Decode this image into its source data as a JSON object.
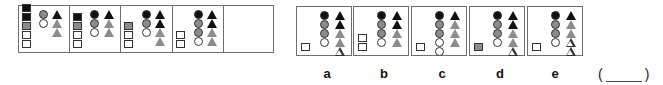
{
  "colors": {
    "black": "#111111",
    "gray": "#8c8c8c",
    "white": "#ffffff",
    "border": "#6e6e6e"
  },
  "sequence": {
    "panels": [
      {
        "squares": [
          "black",
          "black",
          "gray",
          "white",
          "white"
        ],
        "circles": [
          "gray",
          "white"
        ],
        "triangles": [
          "black",
          "gray",
          "gray"
        ]
      },
      {
        "squares": [
          "black",
          "gray",
          "white",
          "white"
        ],
        "circles": [
          "black",
          "gray",
          "white"
        ],
        "triangles": [
          "black",
          "gray",
          "gray"
        ]
      },
      {
        "squares": [
          "gray",
          "white",
          "white"
        ],
        "circles": [
          "black",
          "gray",
          "white"
        ],
        "triangles": [
          "black",
          "black",
          "gray",
          "gray"
        ]
      },
      {
        "squares": [
          "white",
          "white"
        ],
        "circles": [
          "black",
          "gray",
          "gray",
          "white"
        ],
        "triangles": [
          "black",
          "black",
          "gray",
          "gray"
        ]
      },
      {
        "squares": [],
        "circles": [],
        "triangles": [],
        "missing": true
      }
    ]
  },
  "options": [
    {
      "label": "a",
      "squares": [
        "white"
      ],
      "circles": [
        "black",
        "gray",
        "gray",
        "white"
      ],
      "triangles": [
        "black",
        "black",
        "gray",
        "gray",
        "white"
      ]
    },
    {
      "label": "b",
      "squares": [
        "white",
        "white"
      ],
      "circles": [
        "black",
        "gray",
        "gray",
        "white"
      ],
      "triangles": [
        "black",
        "black",
        "gray",
        "gray"
      ]
    },
    {
      "label": "c",
      "squares": [
        "white"
      ],
      "circles": [
        "black",
        "gray",
        "gray",
        "white",
        "white"
      ],
      "triangles": [
        "black",
        "gray",
        "gray",
        "gray"
      ]
    },
    {
      "label": "d",
      "squares": [
        "gray"
      ],
      "circles": [
        "black",
        "gray",
        "gray",
        "white"
      ],
      "triangles": [
        "black",
        "black",
        "gray",
        "gray",
        "white"
      ]
    },
    {
      "label": "e",
      "squares": [
        "white"
      ],
      "circles": [
        "black",
        "gray",
        "gray",
        "white"
      ],
      "triangles": [
        "black",
        "gray",
        "gray",
        "white",
        "white"
      ]
    }
  ],
  "answer": {
    "open": "(",
    "close": ")",
    "value": ""
  }
}
